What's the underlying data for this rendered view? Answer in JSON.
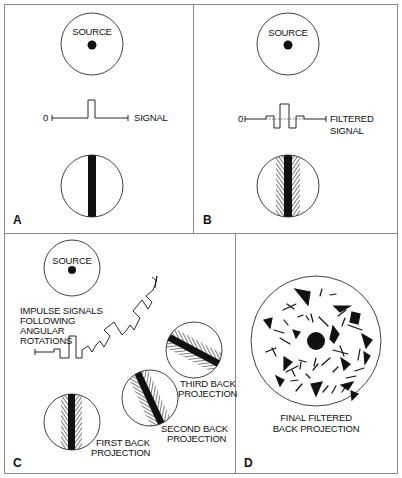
{
  "figure": {
    "panels": [
      {
        "letter": "A",
        "source_label": "SOURCE",
        "signal_label": "SIGNAL",
        "zero_label": "0"
      },
      {
        "letter": "B",
        "source_label": "SOURCE",
        "signal_label_line1": "FILTERED",
        "signal_label_line2": "SIGNAL",
        "zero_label": "0"
      },
      {
        "letter": "C",
        "source_label": "SOURCE",
        "impulse_label_lines": [
          "IMPULSE SIGNALS",
          "FOLLOWING",
          "ANGULAR",
          "ROTATIONS"
        ],
        "first_label_lines": [
          "FIRST BACK",
          "PROJECTION"
        ],
        "second_label_lines": [
          "SECOND BACK",
          "PROJECTION"
        ],
        "third_label_lines": [
          "THIRD BACK",
          "PROJECTION"
        ]
      },
      {
        "letter": "D",
        "final_label_lines": [
          "FINAL FILTERED",
          "BACK PROJECTION"
        ]
      }
    ],
    "colors": {
      "ink": "#111111",
      "border": "#888888",
      "background": "#ffffff"
    }
  }
}
